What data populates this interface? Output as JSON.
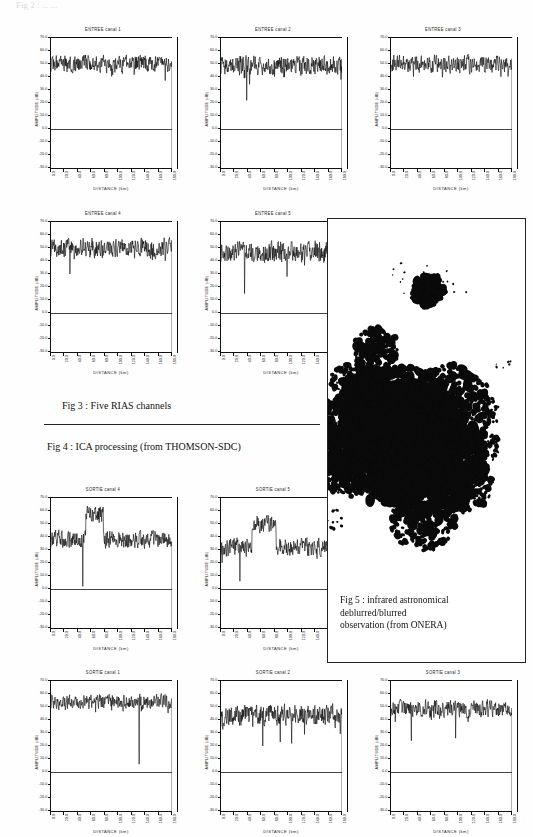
{
  "document": {
    "top_partial_text": "Fig 2 : ... ...",
    "captions": [
      {
        "id": "fig3",
        "text": "Fig 3 : Five RIAS channels"
      },
      {
        "id": "fig4",
        "text": "Fig 4 : ICA processing (from THOMSON-SDC)"
      }
    ],
    "figure5": {
      "caption_lines": [
        "Fig 5 : infrared astronomical",
        "deblurred/blurred",
        "observation (from ONERA)"
      ]
    }
  },
  "axes_common": {
    "xlabel": "DISTANCE  (km)",
    "ylabel": "AMPLITUDE  (dB)",
    "ylim": [
      -30.0,
      70.0
    ],
    "ytick_labels": [
      "70.0",
      "60.0",
      "50.0",
      "40.0",
      "30.0",
      "20.0",
      "10.0",
      "0.0",
      "-10.0",
      "-20.0",
      "-30.0"
    ],
    "ytick_values": [
      70,
      60,
      50,
      40,
      30,
      20,
      10,
      0,
      -10,
      -20,
      -30
    ],
    "xtick_labels": [
      "0.0",
      "20.0",
      "40.0",
      "60.0",
      "80.0",
      "100.0",
      "120.0",
      "140.0",
      "160.0",
      "180.0"
    ],
    "xtick_values": [
      0,
      20,
      40,
      60,
      80,
      100,
      120,
      140,
      160,
      180
    ],
    "xlim": [
      0,
      180
    ],
    "zero_reference": 0.0,
    "grid": false,
    "legend": "none"
  },
  "chart_data": [
    {
      "id": "entree-1",
      "type": "line",
      "title": "ENTREE canal 1",
      "xlabel": "DISTANCE  (km)",
      "ylabel": "AMPLITUDE  (dB)",
      "xlim": [
        0,
        180
      ],
      "ylim": [
        -30,
        70
      ],
      "baseline": 50.0,
      "noise_amp": 6.0,
      "seed": 11,
      "spikes": [],
      "description": "Noisy RIAS input channel 1, mean ~50 dB"
    },
    {
      "id": "entree-2",
      "type": "line",
      "title": "ENTREE canal 2",
      "xlabel": "DISTANCE  (km)",
      "ylabel": "AMPLITUDE  (dB)",
      "xlim": [
        0,
        180
      ],
      "ylim": [
        -30,
        70
      ],
      "baseline": 49.0,
      "noise_amp": 6.5,
      "seed": 23,
      "spikes": [
        [
          38,
          22.0
        ]
      ],
      "description": "Noisy RIAS input channel 2, mean ~49 dB with a deep notch"
    },
    {
      "id": "entree-3",
      "type": "line",
      "title": "ENTREE canal 3",
      "xlabel": "DISTANCE  (km)",
      "ylabel": "AMPLITUDE  (dB)",
      "xlim": [
        0,
        180
      ],
      "ylim": [
        -30,
        70
      ],
      "baseline": 50.0,
      "noise_amp": 6.0,
      "seed": 37,
      "spikes": [],
      "description": "Noisy RIAS input channel 3, mean ~50 dB"
    },
    {
      "id": "entree-4",
      "type": "line",
      "title": "ENTREE canal 4",
      "xlabel": "DISTANCE  (km)",
      "ylabel": "AMPLITUDE  (dB)",
      "xlim": [
        0,
        180
      ],
      "ylim": [
        -30,
        70
      ],
      "baseline": 50.0,
      "noise_amp": 6.5,
      "seed": 53,
      "spikes": [
        [
          28,
          30.0
        ]
      ],
      "description": "Noisy RIAS input channel 4, mean ~50 dB"
    },
    {
      "id": "entree-5",
      "type": "line",
      "title": "ENTREE canal 5",
      "xlabel": "DISTANCE  (km)",
      "ylabel": "AMPLITUDE  (dB)",
      "xlim": [
        0,
        180
      ],
      "ylim": [
        -30,
        70
      ],
      "baseline": 47.0,
      "noise_amp": 7.5,
      "seed": 67,
      "spikes": [
        [
          35,
          15.0
        ],
        [
          98,
          28.0
        ]
      ],
      "description": "Noisy RIAS input channel 5, mean ~47 dB with deep notches"
    },
    {
      "id": "sortie-4",
      "type": "line",
      "title": "SORTIE canal 4",
      "xlabel": "DISTANCE  (km)",
      "ylabel": "AMPLITUDE  (dB)",
      "xlim": [
        0,
        180
      ],
      "ylim": [
        -30,
        70
      ],
      "baseline": 38.0,
      "noise_amp": 6.0,
      "seed": 83,
      "burst": {
        "start": 52,
        "end": 78,
        "level": 58.0
      },
      "spikes": [
        [
          47,
          2.0
        ]
      ],
      "description": "ICA separated output channel 4: localized source burst rising to ~58 dB between 52 and 78 km"
    },
    {
      "id": "sortie-5",
      "type": "line",
      "title": "SORTIE canal 5",
      "xlabel": "DISTANCE  (km)",
      "ylabel": "AMPLITUDE  (dB)",
      "xlim": [
        0,
        180
      ],
      "ylim": [
        -30,
        70
      ],
      "baseline": 32.0,
      "noise_amp": 6.0,
      "seed": 97,
      "burst": {
        "start": 46,
        "end": 82,
        "level": 50.0
      },
      "spikes": [
        [
          28,
          6.0
        ]
      ],
      "description": "ICA separated output channel 5: localized source burst rising to ~50 dB between 46 and 82 km"
    },
    {
      "id": "sortie-1",
      "type": "line",
      "title": "SORTIE canal 1",
      "xlabel": "DISTANCE  (km)",
      "ylabel": "AMPLITUDE  (dB)",
      "xlim": [
        0,
        180
      ],
      "ylim": [
        -30,
        70
      ],
      "baseline": 54.0,
      "noise_amp": 5.0,
      "seed": 113,
      "spikes": [
        [
          131,
          6.0
        ]
      ],
      "description": "ICA separated output channel 1, mean ~54 dB, one isolated deep notch near 131 km"
    },
    {
      "id": "sortie-2",
      "type": "line",
      "title": "SORTIE canal 2",
      "xlabel": "DISTANCE  (km)",
      "ylabel": "AMPLITUDE  (dB)",
      "xlim": [
        0,
        180
      ],
      "ylim": [
        -30,
        70
      ],
      "baseline": 44.0,
      "noise_amp": 7.0,
      "seed": 131,
      "spikes": [
        [
          62,
          20.0
        ],
        [
          88,
          23.0
        ],
        [
          105,
          22.0
        ]
      ],
      "description": "ICA separated output channel 2, mean ~44 dB with multiple notches"
    },
    {
      "id": "sortie-3",
      "type": "line",
      "title": "SORTIE canal 3",
      "xlabel": "DISTANCE  (km)",
      "ylabel": "AMPLITUDE  (dB)",
      "xlim": [
        0,
        180
      ],
      "ylim": [
        -30,
        70
      ],
      "baseline": 49.0,
      "noise_amp": 6.0,
      "seed": 149,
      "spikes": [
        [
          30,
          24.0
        ],
        [
          96,
          26.0
        ]
      ],
      "description": "ICA separated output channel 3, mean ~49 dB"
    }
  ],
  "colors": {
    "ink": "#111111",
    "paper": "#fefefe",
    "rule": "#222222",
    "faint": "#d9d9d9"
  }
}
